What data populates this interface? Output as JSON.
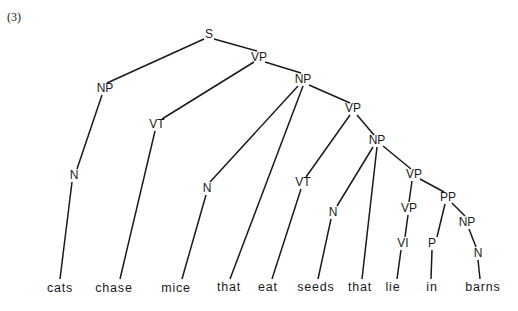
{
  "example_number": "(3)",
  "nodes": [
    {
      "id": "S",
      "label": "S",
      "x": 209,
      "y": 35
    },
    {
      "id": "VP1",
      "label": "VP",
      "x": 259,
      "y": 58
    },
    {
      "id": "NP1",
      "label": "NP",
      "x": 105,
      "y": 89
    },
    {
      "id": "NP2",
      "label": "NP",
      "x": 303,
      "y": 80
    },
    {
      "id": "VT1",
      "label": "VT",
      "x": 157,
      "y": 125
    },
    {
      "id": "VP2",
      "label": "VP",
      "x": 353,
      "y": 109
    },
    {
      "id": "NP3",
      "label": "NP",
      "x": 377,
      "y": 141
    },
    {
      "id": "N1",
      "label": "N",
      "x": 74,
      "y": 176
    },
    {
      "id": "N2",
      "label": "N",
      "x": 207,
      "y": 189
    },
    {
      "id": "VT2",
      "label": "VT",
      "x": 303,
      "y": 183
    },
    {
      "id": "VP3",
      "label": "VP",
      "x": 414,
      "y": 175
    },
    {
      "id": "N3",
      "label": "N",
      "x": 333,
      "y": 213
    },
    {
      "id": "PP",
      "label": "PP",
      "x": 448,
      "y": 198
    },
    {
      "id": "VP4",
      "label": "VP",
      "x": 409,
      "y": 209
    },
    {
      "id": "NP4",
      "label": "NP",
      "x": 467,
      "y": 223
    },
    {
      "id": "VI",
      "label": "VI",
      "x": 403,
      "y": 244
    },
    {
      "id": "P",
      "label": "P",
      "x": 432,
      "y": 244
    },
    {
      "id": "N4",
      "label": "N",
      "x": 478,
      "y": 254
    }
  ],
  "words": [
    {
      "id": "w1",
      "text": "cats",
      "x": 60,
      "y": 289
    },
    {
      "id": "w2",
      "text": "chase",
      "x": 114,
      "y": 289
    },
    {
      "id": "w3",
      "text": "mice",
      "x": 176,
      "y": 289
    },
    {
      "id": "w4",
      "text": "that",
      "x": 229,
      "y": 288
    },
    {
      "id": "w5",
      "text": "eat",
      "x": 268,
      "y": 288
    },
    {
      "id": "w6",
      "text": "seeds",
      "x": 316,
      "y": 288
    },
    {
      "id": "w7",
      "text": "that",
      "x": 360,
      "y": 288
    },
    {
      "id": "w8",
      "text": "lie",
      "x": 393,
      "y": 288
    },
    {
      "id": "w9",
      "text": "in",
      "x": 432,
      "y": 288
    },
    {
      "id": "w10",
      "text": "barns",
      "x": 483,
      "y": 288
    }
  ],
  "edges": [
    {
      "from": "S",
      "to": "NP1",
      "x1": 204,
      "y1": 39,
      "x2": 107,
      "y2": 83
    },
    {
      "from": "S",
      "to": "VP1",
      "x1": 214,
      "y1": 39,
      "x2": 257,
      "y2": 51
    },
    {
      "from": "VP1",
      "to": "VT1",
      "x1": 254,
      "y1": 62,
      "x2": 162,
      "y2": 119
    },
    {
      "from": "VP1",
      "to": "NP2",
      "x1": 265,
      "y1": 62,
      "x2": 301,
      "y2": 73
    },
    {
      "from": "NP1",
      "to": "N1",
      "x1": 102,
      "y1": 95,
      "x2": 77,
      "y2": 169
    },
    {
      "from": "VT1",
      "to": "w2",
      "x1": 155,
      "y1": 131,
      "x2": 120,
      "y2": 279
    },
    {
      "from": "N1",
      "to": "w1",
      "x1": 72,
      "y1": 182,
      "x2": 60,
      "y2": 279
    },
    {
      "from": "NP2",
      "to": "N2",
      "x1": 298,
      "y1": 86,
      "x2": 210,
      "y2": 182
    },
    {
      "from": "NP2",
      "to": "w4",
      "x1": 303,
      "y1": 86,
      "x2": 230,
      "y2": 279
    },
    {
      "from": "NP2",
      "to": "VP2",
      "x1": 309,
      "y1": 85,
      "x2": 350,
      "y2": 103
    },
    {
      "from": "N2",
      "to": "w3",
      "x1": 206,
      "y1": 195,
      "x2": 182,
      "y2": 279
    },
    {
      "from": "VP2",
      "to": "VT2",
      "x1": 350,
      "y1": 115,
      "x2": 306,
      "y2": 177
    },
    {
      "from": "VP2",
      "to": "NP3",
      "x1": 357,
      "y1": 115,
      "x2": 374,
      "y2": 135
    },
    {
      "from": "VT2",
      "to": "w5",
      "x1": 301,
      "y1": 189,
      "x2": 272,
      "y2": 279
    },
    {
      "from": "NP3",
      "to": "N3",
      "x1": 373,
      "y1": 147,
      "x2": 337,
      "y2": 206
    },
    {
      "from": "NP3",
      "to": "w7",
      "x1": 377,
      "y1": 147,
      "x2": 362,
      "y2": 279
    },
    {
      "from": "NP3",
      "to": "VP3",
      "x1": 383,
      "y1": 146,
      "x2": 411,
      "y2": 169
    },
    {
      "from": "N3",
      "to": "w6",
      "x1": 331,
      "y1": 219,
      "x2": 318,
      "y2": 279
    },
    {
      "from": "VP3",
      "to": "VP4",
      "x1": 412,
      "y1": 181,
      "x2": 409,
      "y2": 202
    },
    {
      "from": "VP3",
      "to": "PP",
      "x1": 420,
      "y1": 179,
      "x2": 444,
      "y2": 192
    },
    {
      "from": "VP4",
      "to": "VI",
      "x1": 408,
      "y1": 215,
      "x2": 405,
      "y2": 237
    },
    {
      "from": "VI",
      "to": "w8",
      "x1": 401,
      "y1": 250,
      "x2": 397,
      "y2": 279
    },
    {
      "from": "PP",
      "to": "P",
      "x1": 445,
      "y1": 204,
      "x2": 437,
      "y2": 237
    },
    {
      "from": "PP",
      "to": "NP4",
      "x1": 452,
      "y1": 203,
      "x2": 465,
      "y2": 216
    },
    {
      "from": "P",
      "to": "w9",
      "x1": 432,
      "y1": 250,
      "x2": 431,
      "y2": 279
    },
    {
      "from": "NP4",
      "to": "N4",
      "x1": 469,
      "y1": 229,
      "x2": 476,
      "y2": 247
    },
    {
      "from": "N4",
      "to": "w10",
      "x1": 478,
      "y1": 260,
      "x2": 480,
      "y2": 279
    }
  ]
}
